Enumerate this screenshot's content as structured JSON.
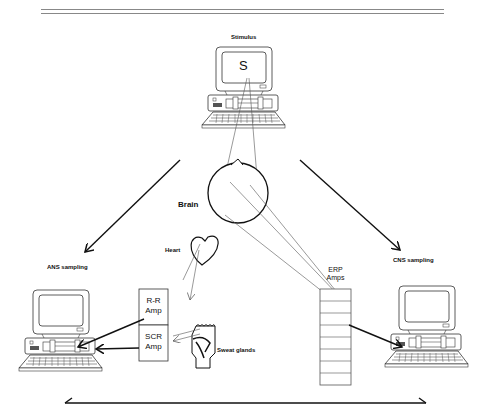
{
  "header": {
    "title_fragment": "...psychophysiology"
  },
  "labels": {
    "stimulus": "Stimulus",
    "screen_letter": "S",
    "brain": "Brain",
    "heart": "Heart",
    "ans_sampling": "ANS sampling",
    "cns_sampling": "CNS sampling",
    "rr_amp_line1": "R-R",
    "rr_amp_line2": "Amp",
    "scr_amp_line1": "SCR",
    "scr_amp_line2": "Amp",
    "erp_amps_line1": "ERP",
    "erp_amps_line2": "Amps",
    "sweat_glands": "Sweat glands"
  },
  "erp_channels": 8,
  "colors": {
    "line": "#111111",
    "thin_line": "#555555",
    "background": "#ffffff"
  }
}
